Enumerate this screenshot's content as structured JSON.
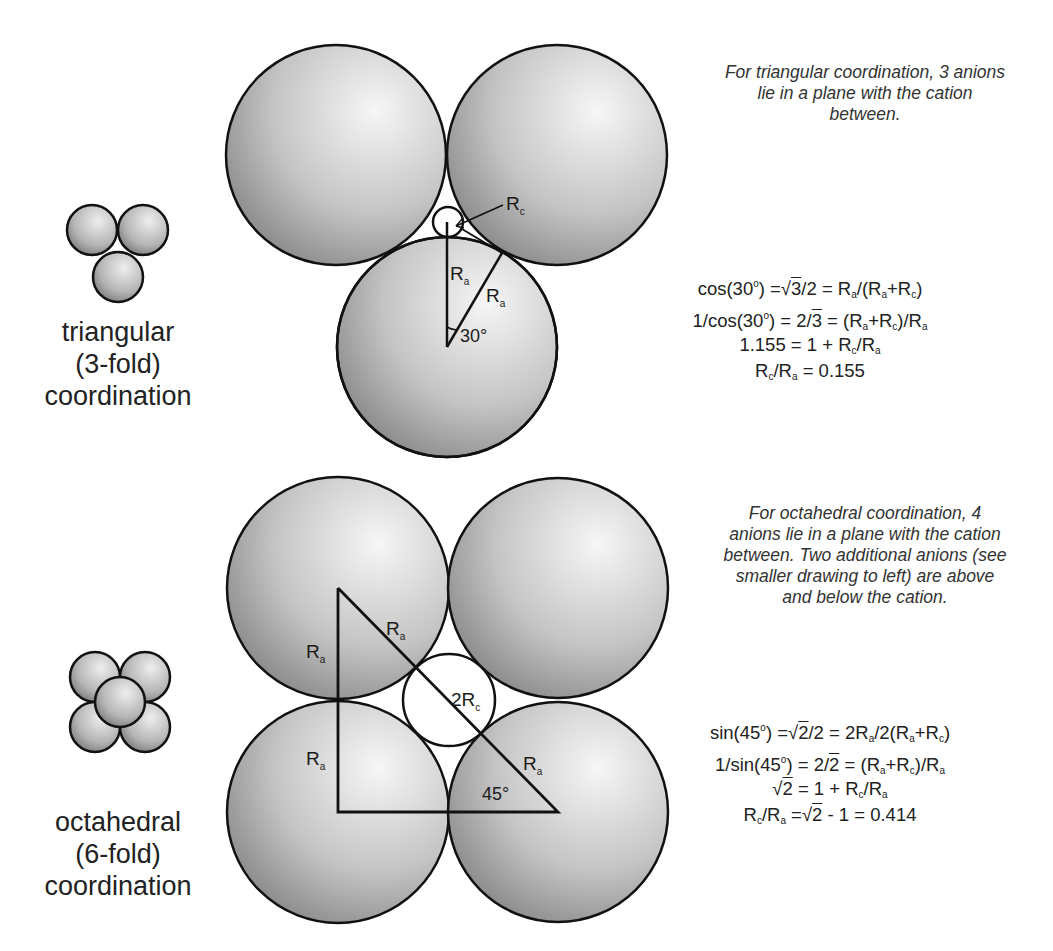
{
  "colors": {
    "sphere_light": "#f4f4f4",
    "sphere_dark": "#8a8a8a",
    "outline": "#111111",
    "text": "#222222"
  },
  "triangular": {
    "label_lines": [
      "triangular",
      "(3-fold)",
      "coordination"
    ],
    "description_lines": [
      "For triangular coordination, 3 anions",
      "lie in a plane with the cation",
      "between."
    ],
    "diagram_labels": {
      "rc": "R",
      "rc_sub": "c",
      "ra_vertical": "R",
      "ra_vertical_sub": "a",
      "ra_diagonal": "R",
      "ra_diagonal_sub": "a",
      "angle": "30°"
    },
    "equations": [
      "cos(30°) = √3/2 = Ra/(Ra+Rc)",
      "1/cos(30°) = 2/√3 = (Ra+Rc)/Ra",
      "1.155 = 1 + Rc/Ra",
      "Rc/Ra = 0.155"
    ],
    "eq_parts": {
      "e1": {
        "a": "cos(30",
        "deg": "o",
        "b": ") =",
        "rad": "3",
        "c": "/2 = R",
        "s1": "a",
        "d": "/(R",
        "s2": "a",
        "e": "+R",
        "s3": "c",
        "f": ")"
      },
      "e2": {
        "a": "1/cos(30",
        "deg": "o",
        "b": ") = 2/",
        "rad": "3",
        "c": " = (R",
        "s1": "a",
        "d": "+R",
        "s2": "c",
        "e": ")/R",
        "s3": "a"
      },
      "e3": {
        "a": "1.155 = 1 + R",
        "s1": "c",
        "b": "/R",
        "s2": "a"
      },
      "e4": {
        "a": "R",
        "s1": "c",
        "b": "/R",
        "s2": "a",
        "c": " =  0.155"
      }
    }
  },
  "octahedral": {
    "label_lines": [
      "octahedral",
      "(6-fold)",
      "coordination"
    ],
    "description_lines": [
      "For octahedral coordination, 4",
      "anions lie in a plane with the cation",
      "between. Two additional anions (see",
      "smaller drawing to left) are above",
      "and below the cation."
    ],
    "diagram_labels": {
      "ra_upper_left": "R",
      "ra_upper_left_sub": "a",
      "ra_hyp_upper": "R",
      "ra_hyp_upper_sub": "a",
      "two_rc": "2R",
      "two_rc_sub": "c",
      "ra_lower_left": "R",
      "ra_lower_left_sub": "a",
      "ra_hyp_lower": "R",
      "ra_hyp_lower_sub": "a",
      "angle": "45°"
    },
    "equations": [
      "sin(45°) = √2/2 = 2Ra/2(Ra+Rc)",
      "1/sin(45°) = 2/√2 = (Ra+Rc)/Ra",
      "√2 = 1 + Rc/Ra",
      "Rc/Ra = √2 - 1 = 0.414"
    ],
    "eq_parts": {
      "e1": {
        "a": "sin(45",
        "deg": "o",
        "b": ") =",
        "rad": "2",
        "c": "/2 = 2R",
        "s1": "a",
        "d": "/2(R",
        "s2": "a",
        "e": "+R",
        "s3": "c",
        "f": ")"
      },
      "e2": {
        "a": "1/sin(45",
        "deg": "o",
        "b": ") = 2/",
        "rad": "2",
        "c": " = (R",
        "s1": "a",
        "d": "+R",
        "s2": "c",
        "e": ")/R",
        "s3": "a"
      },
      "e3": {
        "rad": "2",
        "a": " = 1 + R",
        "s1": "c",
        "b": "/R",
        "s2": "a"
      },
      "e4": {
        "a": "R",
        "s1": "c",
        "b": "/R",
        "s2": "a",
        "c": " =",
        "rad": "2",
        "d": " - 1 = 0.414"
      }
    }
  }
}
